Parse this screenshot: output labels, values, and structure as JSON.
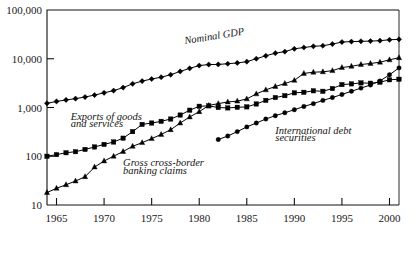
{
  "chart_data": {
    "type": "line",
    "title": "",
    "subtitle": "",
    "xlabel": "",
    "ylabel": "",
    "yscale": "log",
    "ylim": [
      10,
      100000
    ],
    "xlim": [
      1964,
      2001
    ],
    "grid": false,
    "legend_position": "inline-annotations",
    "ytick_labels": [
      "100,000",
      "10,000",
      "1,000",
      "100",
      "10"
    ],
    "ytick_values": [
      100000,
      10000,
      1000,
      100,
      10
    ],
    "xtick_labels": [
      "1965",
      "1970",
      "1975",
      "1980",
      "1985",
      "1990",
      "1995",
      "2000"
    ],
    "xtick_values": [
      1965,
      1970,
      1975,
      1980,
      1985,
      1990,
      1995,
      2000
    ],
    "series": [
      {
        "name": "Nominal GDP",
        "marker": "diamond",
        "color": "#000000",
        "x": [
          1964,
          1965,
          1966,
          1967,
          1968,
          1969,
          1970,
          1971,
          1972,
          1973,
          1974,
          1975,
          1976,
          1977,
          1978,
          1979,
          1980,
          1981,
          1982,
          1983,
          1984,
          1985,
          1986,
          1987,
          1988,
          1989,
          1990,
          1991,
          1992,
          1993,
          1994,
          1995,
          1996,
          1997,
          1998,
          1999,
          2000,
          2001
        ],
        "values": [
          1220,
          1330,
          1430,
          1520,
          1640,
          1800,
          2000,
          2220,
          2560,
          3060,
          3480,
          3840,
          4180,
          4700,
          5500,
          6350,
          7250,
          7600,
          7650,
          7900,
          8200,
          8700,
          10000,
          11500,
          13000,
          14000,
          16000,
          17000,
          18000,
          18500,
          20000,
          22000,
          22500,
          22800,
          23000,
          23500,
          24500,
          25000
        ]
      },
      {
        "name": "Exports of goods and services",
        "marker": "square",
        "color": "#000000",
        "x": [
          1964,
          1965,
          1966,
          1967,
          1968,
          1969,
          1970,
          1971,
          1972,
          1973,
          1974,
          1975,
          1976,
          1977,
          1978,
          1979,
          1980,
          1981,
          1982,
          1983,
          1984,
          1985,
          1986,
          1987,
          1988,
          1989,
          1990,
          1991,
          1992,
          1993,
          1994,
          1995,
          1996,
          1997,
          1998,
          1999,
          2000,
          2001
        ],
        "values": [
          100,
          108,
          118,
          124,
          138,
          155,
          175,
          196,
          235,
          320,
          450,
          480,
          520,
          580,
          700,
          880,
          1060,
          1080,
          1000,
          980,
          1010,
          1030,
          1180,
          1400,
          1600,
          1750,
          2000,
          2050,
          2200,
          2150,
          2450,
          2950,
          3050,
          3200,
          3150,
          3300,
          3700,
          3800
        ]
      },
      {
        "name": "Gross cross-border banking claims",
        "marker": "triangle",
        "color": "#000000",
        "x": [
          1964,
          1965,
          1966,
          1967,
          1968,
          1969,
          1970,
          1971,
          1972,
          1973,
          1974,
          1975,
          1976,
          1977,
          1978,
          1979,
          1980,
          1981,
          1982,
          1983,
          1984,
          1985,
          1986,
          1987,
          1988,
          1989,
          1990,
          1991,
          1992,
          1993,
          1994,
          1995,
          1996,
          1997,
          1998,
          1999,
          2000,
          2001
        ],
        "values": [
          18,
          22,
          26,
          31,
          38,
          60,
          80,
          100,
          125,
          160,
          190,
          230,
          280,
          350,
          480,
          640,
          820,
          1100,
          1200,
          1300,
          1350,
          1500,
          1900,
          2300,
          2700,
          3100,
          3600,
          5000,
          5300,
          5400,
          5700,
          6600,
          7000,
          7600,
          8000,
          8500,
          9500,
          10500
        ]
      },
      {
        "name": "International debt securities",
        "marker": "circle",
        "color": "#000000",
        "x": [
          1982,
          1983,
          1984,
          1985,
          1986,
          1987,
          1988,
          1989,
          1990,
          1991,
          1992,
          1993,
          1994,
          1995,
          1996,
          1997,
          1998,
          1999,
          2000,
          2001
        ],
        "values": [
          220,
          260,
          320,
          400,
          480,
          580,
          680,
          780,
          900,
          1050,
          1200,
          1400,
          1600,
          1850,
          2150,
          2500,
          2900,
          3500,
          4700,
          6500
        ]
      }
    ],
    "annotations": [
      {
        "name": "nominal-gdp-label",
        "text": "Nominal GDP",
        "x": 1978.5,
        "y": 20000,
        "rotation": -9
      },
      {
        "name": "exports-label-line1",
        "text": "Exports of goods",
        "x": 1966.5,
        "y": 560,
        "rotation": 0
      },
      {
        "name": "exports-label-line2",
        "text": "and services",
        "x": 1966.5,
        "y": 400,
        "rotation": 0
      },
      {
        "name": "banking-claims-label-line1",
        "text": "Gross cross-border",
        "x": 1972,
        "y": 62,
        "rotation": 0
      },
      {
        "name": "banking-claims-label-line2",
        "text": "banking claims",
        "x": 1972,
        "y": 44,
        "rotation": 0
      },
      {
        "name": "debt-securities-label-line1",
        "text": "International debt",
        "x": 1988,
        "y": 290,
        "rotation": 0
      },
      {
        "name": "debt-securities-label-line2",
        "text": "securities",
        "x": 1988,
        "y": 205,
        "rotation": 0
      }
    ]
  }
}
